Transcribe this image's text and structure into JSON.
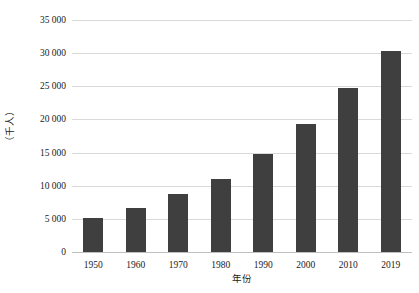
{
  "chart_data": {
    "type": "bar",
    "title": "",
    "subtitle": "",
    "xlabel": "年份",
    "ylabel": "（千人）",
    "categories": [
      "1950",
      "1960",
      "1970",
      "1980",
      "1990",
      "2000",
      "2010",
      "2019"
    ],
    "values": [
      5100,
      6700,
      8750,
      11050,
      14800,
      19300,
      24700,
      30400
    ],
    "series": [
      {
        "name": "人口",
        "values": [
          5100,
          6700,
          8750,
          11050,
          14800,
          19300,
          24700,
          30400
        ]
      }
    ],
    "ylim": [
      0,
      35000
    ],
    "ytick_values": [
      0,
      5000,
      10000,
      15000,
      20000,
      25000,
      30000,
      35000
    ],
    "ytick_labels": [
      "0",
      "5 000",
      "10 000",
      "15 000",
      "20 000",
      "25 000",
      "30 000",
      "35 000"
    ],
    "xtick_labels": [
      "1950",
      "1960",
      "1970",
      "1980",
      "1990",
      "2000",
      "2010",
      "2019"
    ],
    "grid": true,
    "grid_axis": "y",
    "legend": false,
    "legend_position": "none",
    "bar_color": "#3f3f3f",
    "gridline_color": "#d9d9d9",
    "background_color": "#ffffff",
    "text_color": "#1a1a1a"
  }
}
